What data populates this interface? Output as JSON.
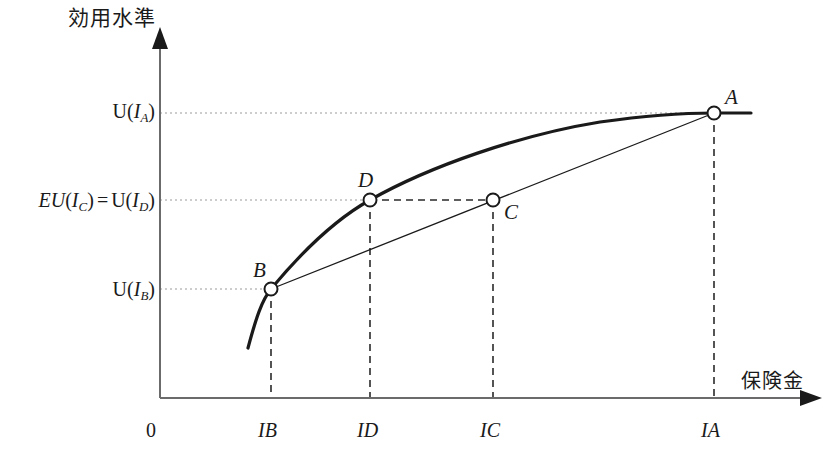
{
  "figure": {
    "type": "diagram",
    "background_color": "#ffffff",
    "ink_color": "#1a1a1a",
    "guide_color": "#9a9a9a"
  },
  "axes": {
    "y_title": "効用水準",
    "x_title": "保険金",
    "origin_label": "0",
    "x_axis_y_px": 398,
    "y_axis_x_px": 160
  },
  "y_ticks": [
    {
      "id": "UA",
      "html": "U(I_A)",
      "value_px": 111
    },
    {
      "id": "EUC",
      "html": "EU(I_C) = U(I_D)",
      "value_px": 200
    },
    {
      "id": "UB",
      "html": "U(I_B)",
      "value_px": 289
    }
  ],
  "x_ticks": [
    {
      "id": "IB",
      "label": "I_B",
      "value_px": 271
    },
    {
      "id": "ID",
      "label": "I_D",
      "value_px": 370
    },
    {
      "id": "IC",
      "label": "I_C",
      "value_px": 493
    },
    {
      "id": "IA",
      "label": "I_A",
      "value_px": 714
    }
  ],
  "points": [
    {
      "name": "A",
      "x_px": 714,
      "y_px": 113,
      "label_dx": 11,
      "label_dy": -26,
      "on": "utility-curve"
    },
    {
      "name": "B",
      "x_px": 271,
      "y_px": 289,
      "label_dx": -18,
      "label_dy": -29,
      "on": "utility-curve"
    },
    {
      "name": "C",
      "x_px": 493,
      "y_px": 200,
      "label_dx": 11,
      "label_dy": 2,
      "on": "chord"
    },
    {
      "name": "D",
      "x_px": 370,
      "y_px": 200,
      "label_dx": -8,
      "label_dy": -30,
      "on": "utility-curve"
    }
  ],
  "curves": [
    {
      "name": "utility-curve",
      "description": "concave increasing utility function U(I)",
      "stroke_width": 3.2,
      "path": "M 248 348 C 256 318, 262 300, 271 289 C 300 254, 336 219, 370 200 C 430 166, 520 135, 600 122 C 650 115, 690 113, 714 113 L 751 113"
    },
    {
      "name": "chord-BA",
      "description": "straight line connecting B and A (expected utility line)",
      "stroke_width": 1.3,
      "path": "M 271 289 L 714 113"
    }
  ],
  "guides": {
    "horizontal_dotted": [
      {
        "from_x": 160,
        "to_x": 714,
        "y": 113,
        "style": "dotted",
        "for": "U(I_A)"
      },
      {
        "from_x": 160,
        "to_x": 370,
        "y": 200,
        "style": "dotted",
        "for": "EU(I_C) = U(I_D)"
      },
      {
        "from_x": 160,
        "to_x": 271,
        "y": 289,
        "style": "dotted",
        "for": "U(I_B)"
      }
    ],
    "horizontal_dashed": [
      {
        "from_x": 370,
        "to_x": 493,
        "y": 200,
        "style": "dashed",
        "for": "D-to-C"
      }
    ],
    "vertical_dashed": [
      {
        "x": 271,
        "from_y": 289,
        "to_y": 398,
        "for": "I_B"
      },
      {
        "x": 370,
        "from_y": 200,
        "to_y": 398,
        "for": "I_D"
      },
      {
        "x": 493,
        "from_y": 200,
        "to_y": 398,
        "for": "I_C"
      },
      {
        "x": 714,
        "from_y": 113,
        "to_y": 398,
        "for": "I_A"
      }
    ]
  }
}
